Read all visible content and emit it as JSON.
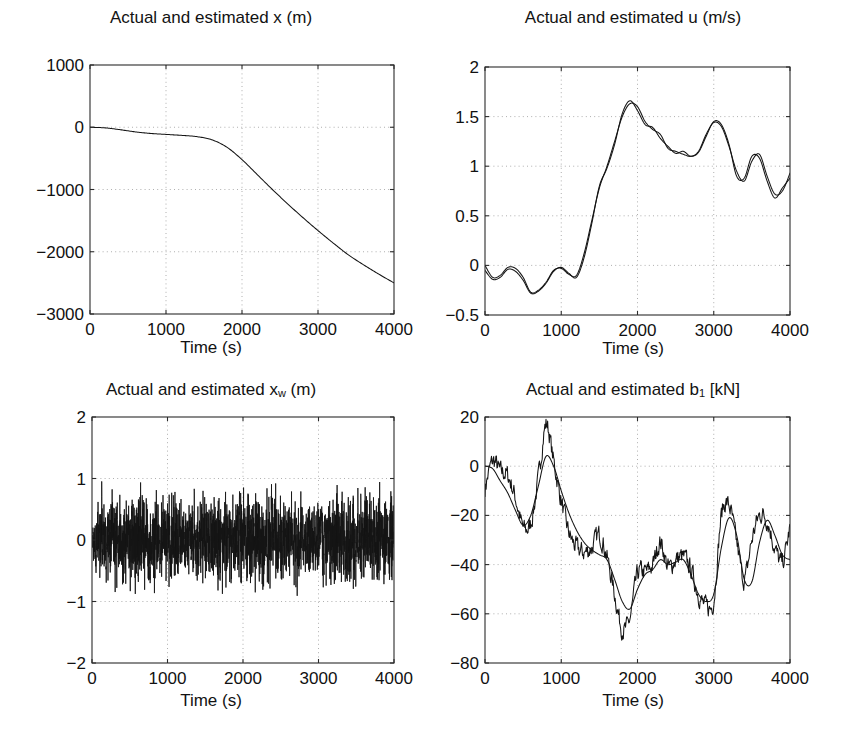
{
  "figure": {
    "background": "#ffffff",
    "line_color": "#141414",
    "grid_color": "#9a9a9a",
    "axis_color": "#2b2b2b",
    "layout": "2x2 grid of time-series subplots"
  },
  "panels": [
    {
      "name": "panel-x",
      "title_main": "Actual and estimated x (m)",
      "title_pre": "Actual and estimated x (m)",
      "title_sub": "",
      "title_post": "",
      "xlabel": "Time (s)",
      "ylabel": "",
      "xticks": [
        "0",
        "1000",
        "2000",
        "3000",
        "4000"
      ],
      "yticks": [
        "1000",
        "0",
        "-1000",
        "-2000",
        "-3000"
      ],
      "box": {
        "x": 90,
        "y": 65,
        "w": 304,
        "h": 249
      }
    },
    {
      "name": "panel-u",
      "title_main": "Actual and estimated u (m/s)",
      "title_pre": "Actual and estimated u (m/s)",
      "title_sub": "",
      "title_post": "",
      "xlabel": "Time (s)",
      "ylabel": "",
      "xticks": [
        "0",
        "1000",
        "2000",
        "3000",
        "4000"
      ],
      "yticks": [
        "2",
        "1.5",
        "1",
        "0.5",
        "0",
        "-0.5"
      ],
      "box": {
        "x": 485,
        "y": 67,
        "w": 305,
        "h": 248
      }
    },
    {
      "name": "panel-xw",
      "title_main": "Actual and estimated xw (m)",
      "title_pre": "Actual and estimated x",
      "title_sub": "w",
      "title_post": " (m)",
      "xlabel": "Time (s)",
      "ylabel": "",
      "xticks": [
        "0",
        "1000",
        "2000",
        "3000",
        "4000"
      ],
      "yticks": [
        "2",
        "1",
        "0",
        "-1",
        "-2"
      ],
      "box": {
        "x": 92,
        "y": 417,
        "w": 302,
        "h": 246
      }
    },
    {
      "name": "panel-b1",
      "title_main": "Actual and estimated b1 [kN]",
      "title_pre": "Actual and estimated b",
      "title_sub": "1",
      "title_post": " [kN]",
      "xlabel": "Time (s)",
      "ylabel": "",
      "xticks": [
        "0",
        "1000",
        "2000",
        "3000",
        "4000"
      ],
      "yticks": [
        "20",
        "0",
        "-20",
        "-40",
        "-60",
        "-80"
      ],
      "box": {
        "x": 485,
        "y": 417,
        "w": 305,
        "h": 246
      }
    }
  ],
  "chart_data": [
    {
      "type": "line",
      "panel": "panel-x",
      "title": "Actual and estimated x (m)",
      "xlabel": "Time (s)",
      "ylabel": "x (m)",
      "xlim": [
        0,
        4000
      ],
      "ylim": [
        -3000,
        1000
      ],
      "xticks": [
        0,
        1000,
        2000,
        3000,
        4000
      ],
      "yticks": [
        1000,
        0,
        -1000,
        -2000,
        -3000
      ],
      "grid": true,
      "legend": null,
      "series": [
        {
          "name": "actual and estimated x",
          "x": [
            0,
            200,
            400,
            600,
            800,
            1000,
            1200,
            1400,
            1600,
            1800,
            2000,
            2200,
            2400,
            2600,
            2800,
            3000,
            3200,
            3400,
            3600,
            3800,
            4000
          ],
          "values": [
            0,
            -10,
            -40,
            -75,
            -100,
            -115,
            -130,
            -150,
            -200,
            -320,
            -520,
            -760,
            -1000,
            -1230,
            -1450,
            -1660,
            -1860,
            -2050,
            -2210,
            -2360,
            -2500
          ]
        }
      ]
    },
    {
      "type": "line",
      "panel": "panel-u",
      "title": "Actual and estimated u (m/s)",
      "xlabel": "Time (s)",
      "ylabel": "u (m/s)",
      "xlim": [
        0,
        4000
      ],
      "ylim": [
        -0.5,
        2
      ],
      "xticks": [
        0,
        1000,
        2000,
        3000,
        4000
      ],
      "yticks": [
        2,
        1.5,
        1,
        0.5,
        0,
        -0.5
      ],
      "grid": true,
      "legend": null,
      "series": [
        {
          "name": "actual u",
          "x": [
            0,
            100,
            200,
            300,
            400,
            500,
            600,
            700,
            800,
            900,
            1000,
            1100,
            1200,
            1300,
            1400,
            1500,
            1600,
            1700,
            1800,
            1900,
            2000,
            2100,
            2200,
            2300,
            2400,
            2500,
            2600,
            2700,
            2800,
            2900,
            3000,
            3100,
            3200,
            3300,
            3400,
            3500,
            3600,
            3700,
            3800,
            3900,
            4000
          ],
          "values": [
            0.0,
            -0.12,
            -0.1,
            -0.02,
            -0.03,
            -0.12,
            -0.27,
            -0.25,
            -0.17,
            -0.05,
            -0.03,
            -0.09,
            -0.1,
            0.12,
            0.45,
            0.78,
            1.0,
            1.25,
            1.5,
            1.63,
            1.6,
            1.45,
            1.37,
            1.32,
            1.18,
            1.15,
            1.12,
            1.1,
            1.15,
            1.32,
            1.44,
            1.4,
            1.2,
            0.95,
            0.85,
            1.05,
            1.12,
            0.9,
            0.72,
            0.75,
            0.93
          ]
        },
        {
          "name": "estimated u",
          "x": [
            0,
            100,
            200,
            300,
            400,
            500,
            600,
            700,
            800,
            900,
            1000,
            1100,
            1200,
            1300,
            1400,
            1500,
            1600,
            1700,
            1800,
            1900,
            2000,
            2100,
            2200,
            2300,
            2400,
            2500,
            2600,
            2700,
            2800,
            2900,
            3000,
            3100,
            3200,
            3300,
            3400,
            3500,
            3600,
            3700,
            3800,
            3900,
            4000
          ],
          "values": [
            -0.05,
            -0.14,
            -0.12,
            -0.04,
            -0.06,
            -0.15,
            -0.28,
            -0.26,
            -0.18,
            -0.06,
            -0.02,
            -0.08,
            -0.12,
            0.08,
            0.42,
            0.8,
            0.98,
            1.22,
            1.53,
            1.66,
            1.56,
            1.42,
            1.39,
            1.28,
            1.2,
            1.13,
            1.15,
            1.1,
            1.14,
            1.3,
            1.45,
            1.42,
            1.22,
            0.9,
            0.88,
            1.1,
            1.08,
            0.85,
            0.68,
            0.78,
            0.88
          ]
        }
      ]
    },
    {
      "type": "line",
      "panel": "panel-xw",
      "title": "Actual and estimated x_w (m)",
      "xlabel": "Time (s)",
      "ylabel": "x_w (m)",
      "xlim": [
        0,
        4000
      ],
      "ylim": [
        -2,
        2
      ],
      "xticks": [
        0,
        1000,
        2000,
        3000,
        4000
      ],
      "yticks": [
        2,
        1,
        0,
        -1,
        -2
      ],
      "grid": true,
      "legend": null,
      "description": "Dense zero-mean random wave-motion noise, amplitude roughly +/-1 m, occasional peaks to +/-1.2",
      "series": [
        {
          "name": "actual and estimated x_w (noise band)",
          "noise": {
            "mean": 0.0,
            "amplitude": 0.42,
            "peak": 1.15,
            "samples": 2400,
            "seed": 17
          }
        }
      ]
    },
    {
      "type": "line",
      "panel": "panel-b1",
      "title": "Actual and estimated b1 [kN]",
      "xlabel": "Time (s)",
      "ylabel": "b1 [kN]",
      "xlim": [
        0,
        4000
      ],
      "ylim": [
        -80,
        20
      ],
      "xticks": [
        0,
        1000,
        2000,
        3000,
        4000
      ],
      "yticks": [
        20,
        0,
        -20,
        -40,
        -60,
        -80
      ],
      "grid": true,
      "legend": null,
      "series": [
        {
          "name": "actual b1 (noisy)",
          "x": [
            0,
            100,
            200,
            300,
            400,
            500,
            600,
            700,
            800,
            900,
            1000,
            1100,
            1200,
            1300,
            1400,
            1500,
            1600,
            1700,
            1800,
            1900,
            2000,
            2100,
            2200,
            2300,
            2400,
            2500,
            2600,
            2700,
            2800,
            2900,
            3000,
            3100,
            3200,
            3300,
            3400,
            3500,
            3600,
            3700,
            3800,
            3900,
            4000
          ],
          "values": [
            -9,
            2,
            -2,
            -4,
            -13,
            -25,
            -23,
            -5,
            17,
            2,
            -14,
            -27,
            -33,
            -35,
            -33,
            -28,
            -37,
            -52,
            -66,
            -62,
            -44,
            -43,
            -40,
            -31,
            -41,
            -38,
            -37,
            -42,
            -52,
            -57,
            -54,
            -20,
            -16,
            -31,
            -46,
            -30,
            -20,
            -22,
            -33,
            -39,
            -25
          ],
          "noise": {
            "amplitude": 3.2,
            "seed": 7
          }
        },
        {
          "name": "estimated b1 (smooth)",
          "x": [
            0,
            100,
            200,
            300,
            400,
            500,
            600,
            700,
            800,
            900,
            1000,
            1100,
            1200,
            1300,
            1400,
            1500,
            1600,
            1700,
            1800,
            1900,
            2000,
            2100,
            2200,
            2300,
            2400,
            2500,
            2600,
            2700,
            2800,
            2900,
            3000,
            3100,
            3200,
            3300,
            3400,
            3500,
            3600,
            3700,
            3800,
            3900,
            4000
          ],
          "values": [
            0,
            -1,
            -6,
            -11,
            -18,
            -24,
            -20,
            -8,
            4,
            0,
            -10,
            -19,
            -26,
            -31,
            -34,
            -36,
            -38,
            -46,
            -55,
            -58,
            -50,
            -44,
            -42,
            -38,
            -40,
            -39,
            -38,
            -44,
            -52,
            -55,
            -52,
            -33,
            -21,
            -28,
            -46,
            -47,
            -31,
            -22,
            -28,
            -36,
            -38
          ]
        }
      ]
    }
  ]
}
